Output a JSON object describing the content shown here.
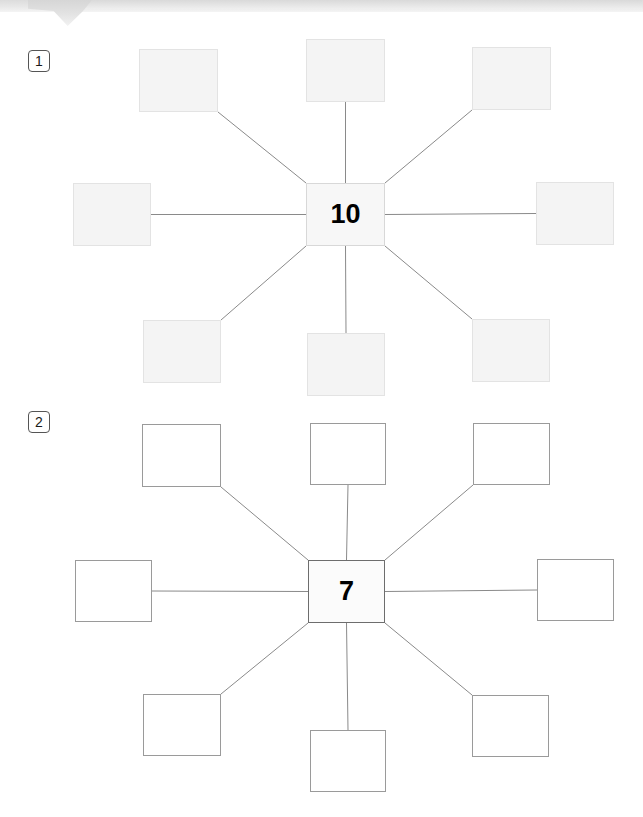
{
  "header": {
    "title": "",
    "tab_icon": "tab-notch"
  },
  "exercises": [
    {
      "number": "1",
      "badge_x": 28,
      "badge_y": 50,
      "style": "shaded",
      "center": {
        "value": "10",
        "x": 306,
        "y": 183,
        "w": 79,
        "h": 63
      },
      "nodes": [
        {
          "position": "top-left",
          "value": "",
          "x": 139,
          "y": 49,
          "w": 79,
          "h": 63
        },
        {
          "position": "top-center",
          "value": "",
          "x": 306,
          "y": 39,
          "w": 79,
          "h": 63
        },
        {
          "position": "top-right",
          "value": "",
          "x": 472,
          "y": 47,
          "w": 79,
          "h": 63
        },
        {
          "position": "middle-left",
          "value": "",
          "x": 73,
          "y": 183,
          "w": 78,
          "h": 63
        },
        {
          "position": "middle-right",
          "value": "",
          "x": 536,
          "y": 182,
          "w": 78,
          "h": 63
        },
        {
          "position": "bottom-left",
          "value": "",
          "x": 143,
          "y": 320,
          "w": 78,
          "h": 63
        },
        {
          "position": "bottom-center",
          "value": "",
          "x": 307,
          "y": 333,
          "w": 78,
          "h": 63
        },
        {
          "position": "bottom-right",
          "value": "",
          "x": 472,
          "y": 319,
          "w": 78,
          "h": 63
        }
      ]
    },
    {
      "number": "2",
      "badge_x": 28,
      "badge_y": 411,
      "style": "outlined",
      "center": {
        "value": "7",
        "x": 308,
        "y": 560,
        "w": 77,
        "h": 63
      },
      "nodes": [
        {
          "position": "top-left",
          "value": "",
          "x": 142,
          "y": 424,
          "w": 79,
          "h": 63
        },
        {
          "position": "top-center",
          "value": "",
          "x": 310,
          "y": 423,
          "w": 76,
          "h": 62
        },
        {
          "position": "top-right",
          "value": "",
          "x": 473,
          "y": 423,
          "w": 77,
          "h": 62
        },
        {
          "position": "middle-left",
          "value": "",
          "x": 75,
          "y": 560,
          "w": 77,
          "h": 62
        },
        {
          "position": "middle-right",
          "value": "",
          "x": 537,
          "y": 559,
          "w": 77,
          "h": 62
        },
        {
          "position": "bottom-left",
          "value": "",
          "x": 143,
          "y": 694,
          "w": 78,
          "h": 62
        },
        {
          "position": "bottom-center",
          "value": "",
          "x": 310,
          "y": 730,
          "w": 76,
          "h": 62
        },
        {
          "position": "bottom-right",
          "value": "",
          "x": 472,
          "y": 695,
          "w": 77,
          "h": 62
        }
      ]
    }
  ],
  "colors": {
    "connector_line": "#8a8a8a",
    "shaded_fill": "#f4f4f4",
    "shaded_border": "#e3e3e3",
    "outlined_border": "#9a9a9a",
    "center_text": "#000000",
    "banner": "#e4e4e4"
  }
}
